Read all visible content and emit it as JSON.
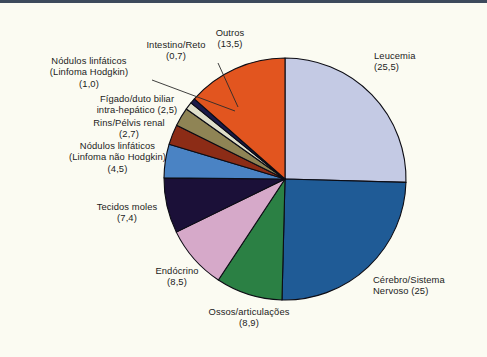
{
  "figure": {
    "background_color": "#fbfbf2",
    "rule_color": "#3d4a5c"
  },
  "chart_data": {
    "type": "pie",
    "title": "",
    "subtitle": "",
    "xlabel": "",
    "ylabel": "",
    "legend_position": "none",
    "grid": false,
    "value_separator": ",",
    "units": "%",
    "start_angle_deg": 0,
    "direction": "clockwise",
    "categories": [
      "Leucemia",
      "Cérebro/Sistema Nervoso",
      "Ossos/articulações",
      "Endócrino",
      "Tecidos moles",
      "Nódulos linfáticos (Linfoma não Hodgkin)",
      "Rins/Pélvis renal",
      "Fígado/duto biliar intra-hepático",
      "Nódulos linfáticos (Linfoma Hodgkin)",
      "Intestino/Reto",
      "Outros"
    ],
    "values": [
      25.5,
      25,
      8.9,
      8.5,
      7.4,
      4.5,
      2.7,
      2.5,
      1.0,
      0.7,
      13.5
    ],
    "colors": [
      "#c4cae4",
      "#1f5b96",
      "#2b8044",
      "#d6a9c9",
      "#1b1038",
      "#4a83c4",
      "#8c2c16",
      "#8f8455",
      "#dfdfcb",
      "#1b1a4a",
      "#e2551f"
    ],
    "slices": [
      {
        "name_lines": [
          "Leucemia"
        ],
        "value_text": "(25,5)",
        "value": 25.5,
        "color": "#c4cae4",
        "align": "left"
      },
      {
        "name_lines": [
          "Cérebro/Sistema"
        ],
        "value_text": "Nervoso (25)",
        "value": 25,
        "color": "#1f5b96",
        "align": "left"
      },
      {
        "name_lines": [
          "Ossos/articulações"
        ],
        "value_text": "(8,9)",
        "value": 8.9,
        "color": "#2b8044",
        "align": "center"
      },
      {
        "name_lines": [
          "Endócrino"
        ],
        "value_text": "(8,5)",
        "value": 8.5,
        "color": "#d6a9c9",
        "align": "center"
      },
      {
        "name_lines": [
          "Tecidos moles"
        ],
        "value_text": "(7,4)",
        "value": 7.4,
        "color": "#1b1038",
        "align": "center"
      },
      {
        "name_lines": [
          "Nódulos linfáticos",
          "(Linfoma não Hodgkin)"
        ],
        "value_text": "(4,5)",
        "value": 4.5,
        "color": "#4a83c4",
        "align": "center"
      },
      {
        "name_lines": [
          "Rins/Pélvis renal"
        ],
        "value_text": "(2,7)",
        "value": 2.7,
        "color": "#8c2c16",
        "align": "center"
      },
      {
        "name_lines": [
          "Fígado/duto biliar"
        ],
        "value_text": "intra-hepático (2,5)",
        "value": 2.5,
        "color": "#8f8455",
        "align": "center"
      },
      {
        "name_lines": [
          "Nódulos linfáticos",
          "(Linfoma Hodgkin)"
        ],
        "value_text": "(1,0)",
        "value": 1.0,
        "color": "#dfdfcb",
        "align": "center"
      },
      {
        "name_lines": [
          "Intestino/Reto"
        ],
        "value_text": "(0,7)",
        "value": 0.7,
        "color": "#1b1a4a",
        "align": "center"
      },
      {
        "name_lines": [
          "Outros"
        ],
        "value_text": "(13,5)",
        "value": 13.5,
        "color": "#e2551f",
        "align": "center"
      }
    ]
  },
  "labels": {
    "leucemia": {
      "line1": "Leucemia",
      "line2": "(25,5)"
    },
    "cerebro": {
      "line1": "Cérebro/Sistema",
      "line2": "Nervoso (25)"
    },
    "ossos": {
      "line1": "Ossos/articulações",
      "line2": "(8,9)"
    },
    "endocrino": {
      "line1": "Endócrino",
      "line2": "(8,5)"
    },
    "tecidos": {
      "line1": "Tecidos moles",
      "line2": "(7,4)"
    },
    "nao_hodgkin": {
      "line1": "Nódulos linfáticos",
      "line2": "(Linfoma não Hodgkin)",
      "line3": "(4,5)"
    },
    "rins": {
      "line1": "Rins/Pélvis renal",
      "line2": "(2,7)"
    },
    "figado": {
      "line1": "Fígado/duto biliar",
      "line2": "intra-hepático (2,5)"
    },
    "hodgkin": {
      "line1": "Nódulos linfáticos",
      "line2": "(Linfoma Hodgkin)",
      "line3": "(1,0)"
    },
    "intestino": {
      "line1": "Intestino/Reto",
      "line2": "(0,7)"
    },
    "outros": {
      "line1": "Outros",
      "line2": "(13,5)"
    }
  }
}
